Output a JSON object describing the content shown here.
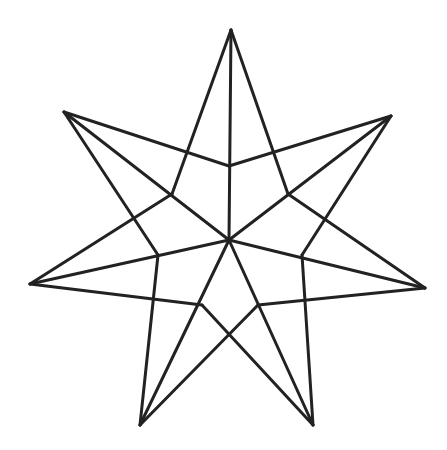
{
  "diagram": {
    "stroke": "#222222",
    "stroke_width": 3,
    "center": [
      229,
      240
    ],
    "tips": [
      [
        231,
        30
      ],
      [
        391,
        116
      ],
      [
        425,
        288
      ],
      [
        313,
        425
      ],
      [
        140,
        425
      ],
      [
        30,
        284
      ],
      [
        64,
        112
      ]
    ],
    "inner": [
      [
        229,
        166
      ],
      [
        288,
        194
      ],
      [
        302,
        255
      ],
      [
        258,
        305
      ],
      [
        202,
        305
      ],
      [
        158,
        255
      ],
      [
        172,
        194
      ]
    ]
  }
}
